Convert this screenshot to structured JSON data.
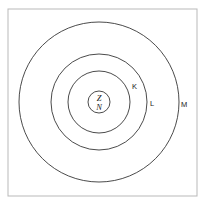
{
  "figure": {
    "background_color": "#ffffff",
    "frame_color": "#b9b9b9",
    "line_color": "#2b2b2b"
  },
  "nucleus": {
    "label_top": "Z",
    "label_bottom": "N",
    "center_x": 99,
    "center_y": 102,
    "radius": 11
  },
  "shells": [
    {
      "label": "K",
      "radius": 31,
      "label_x": 132,
      "label_y": 89
    },
    {
      "label": "L",
      "radius": 48,
      "label_x": 150,
      "label_y": 106
    },
    {
      "label": "M",
      "radius": 80,
      "label_x": 181,
      "label_y": 107
    }
  ],
  "frame": {
    "x": 8,
    "y": 9,
    "width": 189,
    "height": 187
  }
}
